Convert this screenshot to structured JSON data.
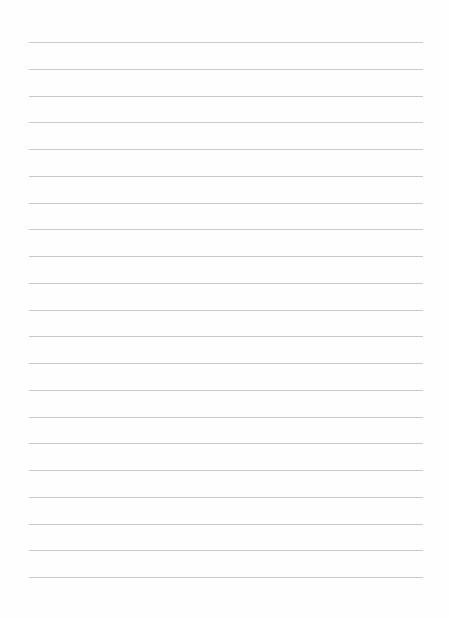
{
  "document": {
    "type": "lined-paper",
    "rule_count": 21,
    "rule_color": "#c9c9c9",
    "background_color": "#fefefe",
    "text_lines": []
  }
}
